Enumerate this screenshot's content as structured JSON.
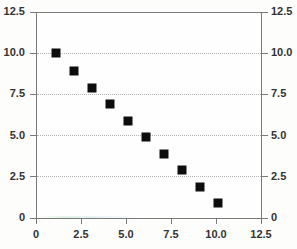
{
  "chart_data": {
    "type": "scatter",
    "title": "",
    "xlabel": "",
    "ylabel": "",
    "xlim": [
      0,
      12.5
    ],
    "ylim": [
      0,
      12.5
    ],
    "grid": true,
    "legend": "none",
    "marker_style": "filled-square",
    "marker_color": "#0d0d0d",
    "x": [
      1.1,
      2.1,
      3.1,
      4.1,
      5.1,
      6.1,
      7.1,
      8.1,
      9.1,
      10.1
    ],
    "y": [
      10.0,
      8.9,
      7.9,
      6.9,
      5.9,
      4.9,
      3.9,
      2.9,
      1.9,
      0.9
    ],
    "points": [
      {
        "x": 1.1,
        "y": 10.0
      },
      {
        "x": 2.1,
        "y": 8.9
      },
      {
        "x": 3.1,
        "y": 7.9
      },
      {
        "x": 4.1,
        "y": 6.9
      },
      {
        "x": 5.1,
        "y": 5.9
      },
      {
        "x": 6.1,
        "y": 4.9
      },
      {
        "x": 7.1,
        "y": 3.9
      },
      {
        "x": 8.1,
        "y": 2.9
      },
      {
        "x": 9.1,
        "y": 1.9
      },
      {
        "x": 10.1,
        "y": 0.9
      }
    ],
    "y_ticks": [
      0,
      2.5,
      5.0,
      7.5,
      10.0,
      12.5
    ],
    "y_tick_labels": [
      "0",
      "2.5",
      "5.0",
      "7.5",
      "10.0",
      "12.5"
    ],
    "y_ticks_right": [
      0,
      2.5,
      5.0,
      7.5,
      10.0,
      12.5
    ],
    "y_tick_labels_right": [
      "0",
      "2.5",
      "5.0",
      "7.5",
      "10.0",
      "12.5"
    ],
    "x_ticks": [
      0,
      2.5,
      5.0,
      7.5,
      10.0,
      12.5
    ],
    "x_tick_labels": [
      "0",
      "2.5",
      "5.0",
      "7.5",
      "10.0",
      "12.5"
    ],
    "gridline_values": [
      2.5,
      5.0,
      7.5,
      10.0
    ],
    "axis_color": "#7a7a7a",
    "grid_color": "#b4b4b4",
    "background_color": "#fdfdfc",
    "plot_background_color": "#fefefe"
  },
  "axes": {
    "left_label": "",
    "right_label": "",
    "bottom_label": "",
    "origin_left_label": "0",
    "origin_right_label": "0"
  }
}
